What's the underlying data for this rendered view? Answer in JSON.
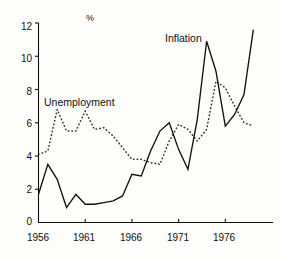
{
  "chart_data": {
    "type": "line",
    "title": "",
    "subtitle": "",
    "xlabel": "",
    "ylabel": "",
    "unit_label": "%",
    "xlim": [
      1956,
      1981
    ],
    "ylim": [
      0,
      12
    ],
    "x_ticks": [
      1956,
      1961,
      1966,
      1971,
      1976
    ],
    "y_ticks": [
      0,
      2,
      4,
      6,
      8,
      10,
      12
    ],
    "grid": false,
    "legend_position": "inline-annotations",
    "series": [
      {
        "name": "Inflation",
        "style": "solid",
        "color": "#111111",
        "label_position": {
          "x": 165,
          "y": 33
        },
        "x": [
          1956,
          1957,
          1958,
          1959,
          1960,
          1961,
          1962,
          1963,
          1964,
          1965,
          1966,
          1967,
          1968,
          1969,
          1970,
          1971,
          1972,
          1973,
          1974,
          1975,
          1976,
          1977,
          1978,
          1979
        ],
        "values": [
          1.7,
          3.5,
          2.6,
          0.9,
          1.7,
          1.1,
          1.1,
          1.2,
          1.3,
          1.6,
          2.9,
          2.8,
          4.3,
          5.5,
          6.0,
          4.4,
          3.2,
          6.2,
          10.9,
          9.1,
          5.8,
          6.5,
          7.7,
          11.6
        ]
      },
      {
        "name": "Unemployment",
        "style": "dotted",
        "color": "#333333",
        "label_position": {
          "x": 44,
          "y": 97
        },
        "x": [
          1956,
          1957,
          1958,
          1959,
          1960,
          1961,
          1962,
          1963,
          1964,
          1965,
          1966,
          1967,
          1968,
          1969,
          1970,
          1971,
          1972,
          1973,
          1974,
          1975,
          1976,
          1977,
          1978,
          1979
        ],
        "values": [
          4.1,
          4.3,
          6.8,
          5.5,
          5.5,
          6.7,
          5.6,
          5.7,
          5.2,
          4.5,
          3.8,
          3.8,
          3.6,
          3.5,
          4.9,
          5.9,
          5.6,
          4.9,
          5.6,
          8.5,
          8.1,
          7.0,
          6.0,
          5.8
        ]
      }
    ]
  },
  "axes": {
    "y_tick_labels": [
      "12",
      "10",
      "8",
      "6",
      "4",
      "2",
      "0"
    ],
    "x_tick_labels": [
      "1956",
      "1961",
      "1966",
      "1971",
      "1976"
    ],
    "unit": "%"
  },
  "annotations": {
    "inflation_label": "Inflation",
    "unemployment_label": "Unemployment"
  }
}
